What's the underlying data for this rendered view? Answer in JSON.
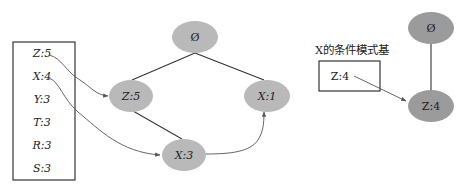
{
  "header_table": {
    "items": [
      {
        "label": "Z:5"
      },
      {
        "label": "X:4"
      },
      {
        "label": "Y:3"
      },
      {
        "label": "T:3"
      },
      {
        "label": "R:3"
      },
      {
        "label": "S:3"
      }
    ]
  },
  "fp_tree": {
    "root": {
      "label": "Ø"
    },
    "nodes": [
      {
        "id": "z5",
        "label": "Z:5"
      },
      {
        "id": "x1",
        "label": "X:1"
      },
      {
        "id": "x3",
        "label": "X:3"
      }
    ],
    "fill_color": "#b9b9b9"
  },
  "conditional": {
    "title": "X的条件模式基",
    "pattern_base": [
      {
        "label": "Z:4"
      }
    ],
    "tree": {
      "root": {
        "label": "Ø"
      },
      "nodes": [
        {
          "id": "z4",
          "label": "Z:4"
        }
      ],
      "fill_color": "#9b9b9b"
    }
  }
}
